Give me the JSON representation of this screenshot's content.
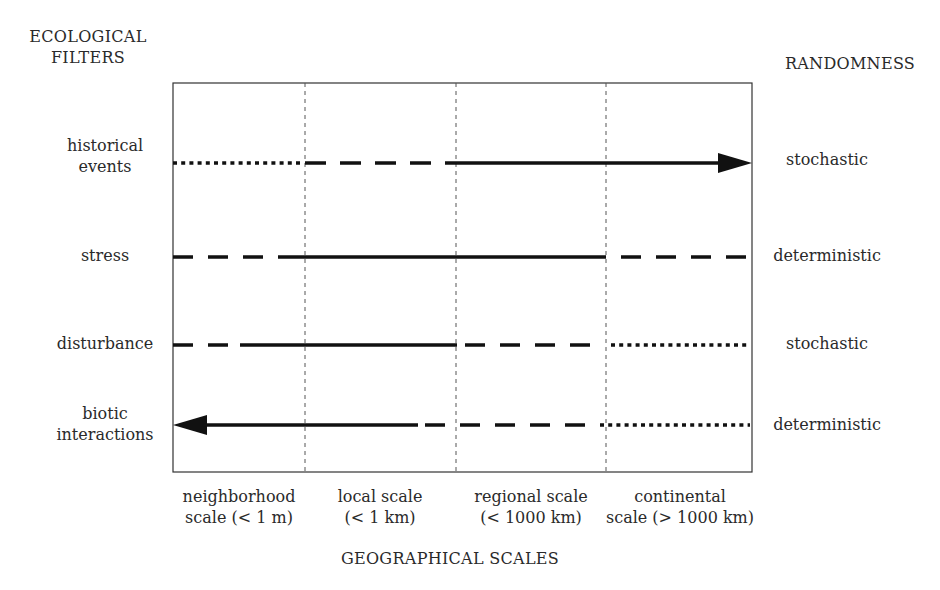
{
  "left_header": {
    "line1": "ECOLOGICAL",
    "line2": "FILTERS"
  },
  "right_header": "RANDOMNESS",
  "x_axis_title": "GEOGRAPHICAL SCALES",
  "scales": [
    {
      "line1": "neighborhood",
      "line2": "scale (< 1 m)"
    },
    {
      "line1": "local scale",
      "line2": "(< 1 km)"
    },
    {
      "line1": "regional scale",
      "line2": "(< 1000 km)"
    },
    {
      "line1": "continental",
      "line2": "scale (> 1000 km)"
    }
  ],
  "filters": [
    {
      "line1": "historical",
      "line2": "events",
      "randomness": "stochastic",
      "segments": [
        "dotted",
        "dashed",
        "solid",
        "solid"
      ],
      "arrow": "right"
    },
    {
      "line1": "stress",
      "line2": "",
      "randomness": "deterministic",
      "segments": [
        "dashed",
        "solid",
        "solid",
        "dashed"
      ],
      "arrow": "none"
    },
    {
      "line1": "disturbance",
      "line2": "",
      "randomness": "stochastic",
      "segments": [
        "dashed",
        "solid",
        "dashed",
        "dotted"
      ],
      "arrow": "none"
    },
    {
      "line1": "biotic",
      "line2": "interactions",
      "randomness": "deterministic",
      "segments": [
        "solid",
        "solid",
        "dashed",
        "dotted"
      ],
      "arrow": "left"
    }
  ],
  "legend": {
    "solid": "strong influence",
    "dashed": "intermediate influence",
    "dotted": "weak influence"
  }
}
